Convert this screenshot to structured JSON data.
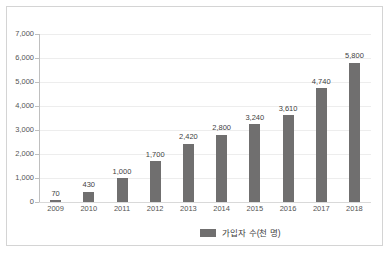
{
  "chart_data": {
    "type": "bar",
    "title": "",
    "xlabel": "",
    "ylabel": "",
    "categories": [
      "2009",
      "2010",
      "2011",
      "2012",
      "2013",
      "2014",
      "2015",
      "2016",
      "2017",
      "2018"
    ],
    "values": [
      70,
      430,
      1000,
      1700,
      2420,
      2800,
      3240,
      3610,
      4740,
      5800
    ],
    "value_labels": [
      "70",
      "430",
      "1,000",
      "1,700",
      "2,420",
      "2,800",
      "3,240",
      "3,610",
      "4,740",
      "5,800"
    ],
    "ylim": [
      0,
      7000
    ],
    "ytick_values": [
      0,
      1000,
      2000,
      3000,
      4000,
      5000,
      6000,
      7000
    ],
    "ytick_labels": [
      "0",
      "1,000",
      "2,000",
      "3,000",
      "4,000",
      "5,000",
      "6,000",
      "7,000"
    ],
    "grid": true,
    "data_labels": true,
    "legend_position": "bottom",
    "series": [
      {
        "name": "가입자 수(천 명)",
        "color": "#706F6F",
        "values": [
          70,
          430,
          1000,
          1700,
          2420,
          2800,
          3240,
          3610,
          4740,
          5800
        ]
      }
    ]
  },
  "legend": {
    "label": "가입자 수(천 명)",
    "swatch_color": "#706F6F"
  },
  "style": {
    "bar_color": "#706F6F",
    "gridline_color": "#EDEDED",
    "axis_color": "#BFBFBF",
    "border_color": "#D4D4D4",
    "background": "#FFFFFF",
    "tick_label_color": "#555555",
    "data_label_color": "#3F3F3F"
  }
}
